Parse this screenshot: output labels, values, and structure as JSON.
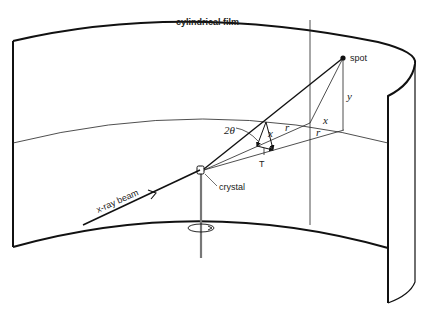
{
  "diagram": {
    "type": "x-ray rotating crystal geometry",
    "labels": {
      "film": "cylindrical film",
      "spot": "spot",
      "crystal": "crystal",
      "beam": "x-ray beam",
      "angle": "2θ",
      "y": "y",
      "x": "x",
      "r_upper": "r",
      "r_lower": "r",
      "rotation_T": "T",
      "vector_x": "x"
    },
    "colors": {
      "ink": "#111111",
      "background": "#ffffff",
      "rod": "#777777"
    }
  }
}
